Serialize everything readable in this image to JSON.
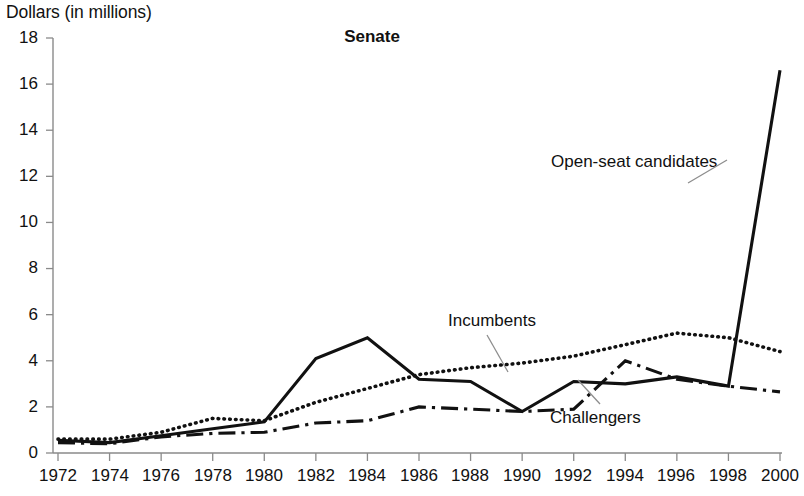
{
  "chart_data": {
    "type": "line",
    "title": "Senate",
    "xlabel": "",
    "ylabel": "Dollars (in millions)",
    "ylim": [
      0,
      18
    ],
    "ytick_values": [
      0,
      2,
      4,
      6,
      8,
      10,
      12,
      14,
      16,
      18
    ],
    "xlim": [
      1972,
      2000
    ],
    "grid": false,
    "legend_position": "inline-annotations",
    "categories": [
      1972,
      1974,
      1976,
      1978,
      1980,
      1982,
      1984,
      1986,
      1988,
      1990,
      1992,
      1994,
      1996,
      1998,
      2000
    ],
    "xtick_labels": [
      "1972",
      "1974",
      "1976",
      "1978",
      "1980",
      "1982",
      "1984",
      "1986",
      "1988",
      "1990",
      "1992",
      "1994",
      "1996",
      "1998",
      "2000"
    ],
    "series": [
      {
        "name": "Open-seat candidates",
        "style": "solid",
        "color": "#111111",
        "values": [
          0.55,
          0.45,
          0.75,
          1.05,
          1.35,
          4.1,
          5.0,
          3.2,
          3.1,
          1.8,
          3.1,
          3.0,
          3.3,
          2.9,
          16.6
        ]
      },
      {
        "name": "Incumbents",
        "style": "dotted",
        "color": "#111111",
        "values": [
          0.6,
          0.6,
          0.9,
          1.5,
          1.4,
          2.2,
          2.8,
          3.4,
          3.7,
          3.9,
          4.2,
          4.7,
          5.2,
          5.0,
          4.4
        ]
      },
      {
        "name": "Challengers",
        "style": "dash-dot",
        "color": "#111111",
        "values": [
          0.45,
          0.4,
          0.7,
          0.85,
          0.9,
          1.3,
          1.4,
          2.0,
          1.9,
          1.8,
          1.9,
          4.0,
          3.2,
          2.9,
          2.65
        ]
      }
    ],
    "annotations": [
      {
        "text": "Open-seat candidates",
        "x_px": 551,
        "y_px": 163
      },
      {
        "text": "Incumbents",
        "x_px": 448,
        "y_px": 322
      },
      {
        "text": "Challengers",
        "x_px": 550,
        "y_px": 418
      }
    ]
  }
}
